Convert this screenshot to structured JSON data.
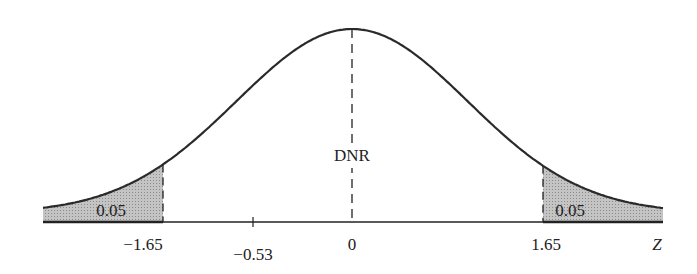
{
  "figure": {
    "center_label": "DNR",
    "tail_left_label": "0.05",
    "tail_right_label": "0.05",
    "axis_label": "Z",
    "ticks": [
      {
        "label": "−1.65",
        "z": -1.65
      },
      {
        "label": "−0.53",
        "z": -0.53
      },
      {
        "label": "0",
        "z": 0
      },
      {
        "label": "1.65",
        "z": 1.65
      }
    ],
    "colors": {
      "curve": "#2a2a2a",
      "shade": "#b8b8b8",
      "axis": "#222222"
    }
  },
  "chart_data": {
    "type": "area",
    "title": "",
    "xlabel": "Z",
    "ylabel": "",
    "xlim": [
      -2.7,
      2.7
    ],
    "critical_values": [
      -1.65,
      1.65
    ],
    "tail_areas": [
      0.05,
      0.05
    ],
    "marked_value": -0.53,
    "regions": [
      {
        "name": "left tail",
        "range": [
          -2.7,
          -1.65
        ],
        "label": "0.05",
        "shaded": true
      },
      {
        "name": "DNR",
        "range": [
          -1.65,
          1.65
        ],
        "label": "DNR",
        "shaded": false
      },
      {
        "name": "right tail",
        "range": [
          1.65,
          2.7
        ],
        "label": "0.05",
        "shaded": true
      }
    ],
    "tick_labels": [
      "−1.65",
      "−0.53",
      "0",
      "1.65"
    ],
    "grid": false,
    "legend": null
  }
}
